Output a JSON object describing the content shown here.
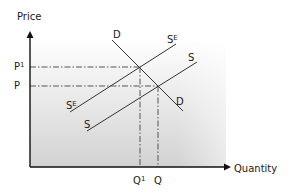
{
  "diagram": {
    "type": "supply-demand",
    "axes": {
      "y_label": "Price",
      "x_label": "Quantity"
    },
    "price_levels": [
      {
        "label": "P",
        "sup": "1",
        "y": 67
      },
      {
        "label": "P",
        "sup": "",
        "y": 86
      }
    ],
    "quantity_levels": [
      {
        "label": "Q",
        "sup": "1",
        "x": 140
      },
      {
        "label": "Q",
        "sup": "",
        "x": 158
      }
    ],
    "curves": [
      {
        "name": "D",
        "type": "demand",
        "label_top": "D",
        "label_bottom": "D"
      },
      {
        "name": "S",
        "type": "supply",
        "label_top": "S",
        "label_bottom": "S"
      },
      {
        "name": "SE",
        "type": "supply-expected",
        "label_top": "S",
        "label_top_sup": "E",
        "label_bottom": "S",
        "label_bottom_sup": "E"
      }
    ],
    "colors": {
      "line": "#333333",
      "axis": "#111111",
      "shade_top": "#ffffff",
      "shade_bottom": "#d0d0d0"
    }
  }
}
